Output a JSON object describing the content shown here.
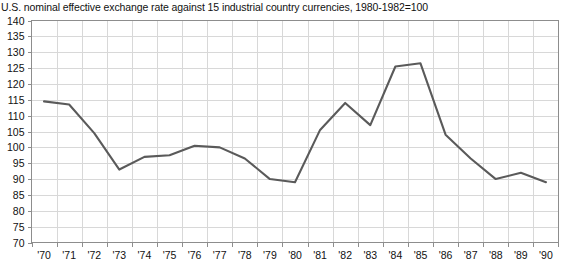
{
  "chart_data": {
    "type": "line",
    "title": "U.S. nominal effective exchange rate against 15 industrial country currencies, 1980-1982=100",
    "xlabel": "",
    "ylabel": "",
    "x": [
      "'70",
      "'71",
      "'72",
      "'73",
      "'74",
      "'75",
      "'76",
      "'77",
      "'78",
      "'79",
      "'80",
      "'81",
      "'82",
      "'83",
      "'84",
      "'85",
      "'86",
      "'87",
      "'88",
      "'89",
      "'90"
    ],
    "values": [
      114.5,
      113.5,
      104.5,
      93.0,
      97.0,
      97.5,
      100.5,
      100.0,
      96.5,
      90.0,
      89.0,
      105.5,
      114.0,
      107.0,
      125.5,
      126.5,
      104.0,
      96.5,
      90.0,
      92.0,
      89.0
    ],
    "ylim": [
      70,
      140
    ],
    "yticks": [
      140,
      135,
      130,
      125,
      120,
      115,
      110,
      105,
      100,
      95,
      90,
      85,
      80,
      75,
      70
    ],
    "ytick_labels": [
      "140",
      "135",
      "130",
      "125",
      "120",
      "115",
      "110",
      "105",
      "100",
      "95",
      "90",
      "85",
      "80",
      "75",
      "70"
    ],
    "grid": true,
    "legend": "none",
    "series_name": "U.S. nominal effective exchange rate",
    "line_color": "#5a5a5a",
    "grid_color": "#d8d8d8",
    "axis_color": "#8d8d8d",
    "background_color": "#ffffff"
  }
}
